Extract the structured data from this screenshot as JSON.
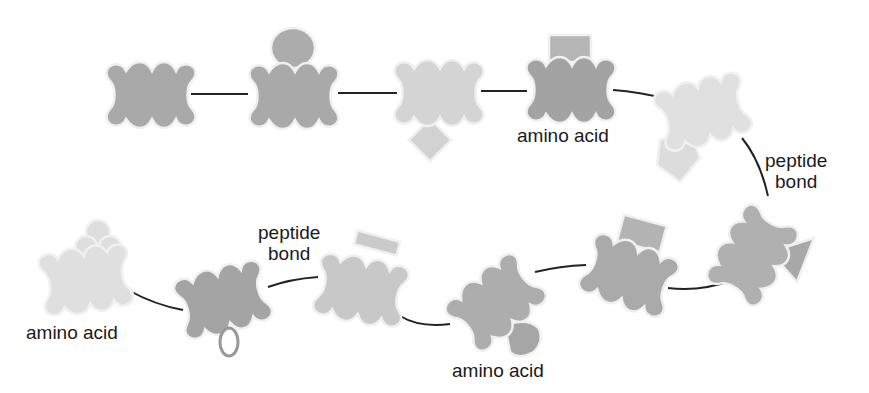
{
  "diagram": {
    "labels": {
      "amino_acid_top": "amino acid",
      "peptide_bond_right_1": "peptide",
      "peptide_bond_right_2": "bond",
      "peptide_bond_left_1": "peptide",
      "peptide_bond_left_2": "bond",
      "amino_acid_left": "amino acid",
      "amino_acid_bottom": "amino acid"
    },
    "colors": {
      "dark": "#a8a8a8",
      "mid": "#c2c2c2",
      "light": "#dedede",
      "outline": "#eeeeee",
      "bond": "#222222"
    },
    "amino_acids": [
      {
        "id": 1,
        "side_group": "none",
        "shade": "dark"
      },
      {
        "id": 2,
        "side_group": "circle",
        "shade": "dark"
      },
      {
        "id": 3,
        "side_group": "diamond",
        "shade": "light"
      },
      {
        "id": 4,
        "side_group": "rectangle",
        "shade": "dark"
      },
      {
        "id": 5,
        "side_group": "pentagon",
        "shade": "light"
      },
      {
        "id": 6,
        "side_group": "triangle",
        "shade": "dark"
      },
      {
        "id": 7,
        "side_group": "rectangle",
        "shade": "dark"
      },
      {
        "id": 8,
        "side_group": "heart",
        "shade": "dark"
      },
      {
        "id": 9,
        "side_group": "t-bar",
        "shade": "mid"
      },
      {
        "id": 10,
        "side_group": "ribbon",
        "shade": "dark"
      },
      {
        "id": 11,
        "side_group": "clover",
        "shade": "light"
      }
    ]
  }
}
